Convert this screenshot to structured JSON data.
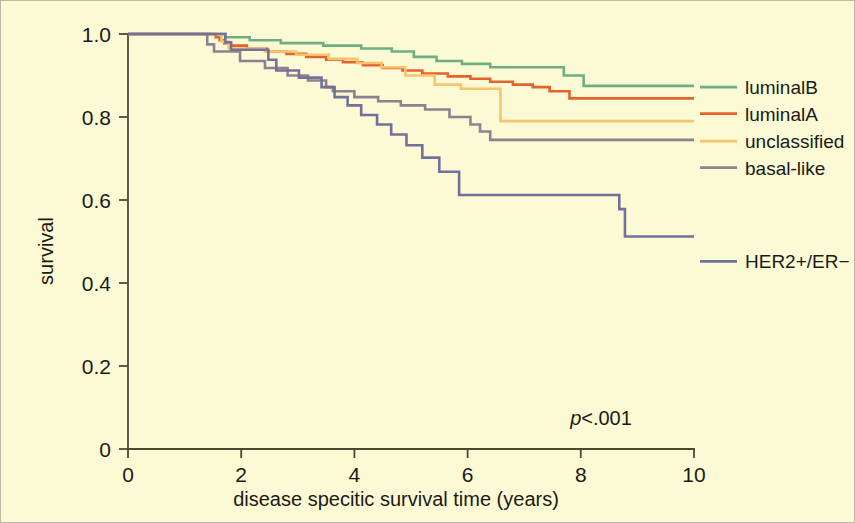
{
  "figure": {
    "background_color": "#fbfad4",
    "frame_color": "#b9b9a8",
    "axis_color": "#4a4a33"
  },
  "chart_data": {
    "type": "line",
    "title": "",
    "subtitle": "",
    "xlabel": "disease specitic survival time  (years)",
    "ylabel": "survival",
    "xlim": [
      0,
      10
    ],
    "ylim": [
      0,
      1.0
    ],
    "xticks": [
      0,
      2,
      4,
      6,
      8,
      10
    ],
    "xticklabels": [
      "0",
      "2",
      "4",
      "6",
      "8",
      "10"
    ],
    "yticks": [
      0,
      0.2,
      0.4,
      0.6,
      0.8,
      1.0
    ],
    "yticklabels": [
      "0",
      "0.2",
      "0.4",
      "0.6",
      "0.8",
      "1.0"
    ],
    "grid": false,
    "legend_position": "right",
    "annotations": [
      {
        "text": "p<.001",
        "italic_prefix": "p",
        "rest": "<.001",
        "x": 7.4,
        "y": 0.115
      }
    ],
    "series": [
      {
        "name": "luminalB",
        "color": "#6fae81",
        "label_y": 0.872,
        "points": [
          [
            0.0,
            1.0
          ],
          [
            0.55,
            1.0
          ],
          [
            1.6,
            1.0
          ],
          [
            1.72,
            0.992
          ],
          [
            2.05,
            0.992
          ],
          [
            2.15,
            0.985
          ],
          [
            2.6,
            0.985
          ],
          [
            2.7,
            0.978
          ],
          [
            3.35,
            0.978
          ],
          [
            3.45,
            0.972
          ],
          [
            4.0,
            0.972
          ],
          [
            4.12,
            0.965
          ],
          [
            4.55,
            0.965
          ],
          [
            4.66,
            0.958
          ],
          [
            4.95,
            0.958
          ],
          [
            5.05,
            0.945
          ],
          [
            5.35,
            0.945
          ],
          [
            5.45,
            0.935
          ],
          [
            5.8,
            0.935
          ],
          [
            5.9,
            0.928
          ],
          [
            6.3,
            0.928
          ],
          [
            6.4,
            0.92
          ],
          [
            7.6,
            0.92
          ],
          [
            7.7,
            0.9
          ],
          [
            7.95,
            0.9
          ],
          [
            8.05,
            0.875
          ],
          [
            10.0,
            0.875
          ]
        ]
      },
      {
        "name": "luminalA",
        "color": "#e4632c",
        "label_y": 0.808,
        "points": [
          [
            0.0,
            1.0
          ],
          [
            0.62,
            1.0
          ],
          [
            1.45,
            1.0
          ],
          [
            1.55,
            0.992
          ],
          [
            1.62,
            0.985
          ],
          [
            1.7,
            0.978
          ],
          [
            1.82,
            0.972
          ],
          [
            2.0,
            0.972
          ],
          [
            2.1,
            0.965
          ],
          [
            2.35,
            0.965
          ],
          [
            2.45,
            0.958
          ],
          [
            2.7,
            0.958
          ],
          [
            2.8,
            0.952
          ],
          [
            3.05,
            0.952
          ],
          [
            3.15,
            0.945
          ],
          [
            3.4,
            0.945
          ],
          [
            3.5,
            0.938
          ],
          [
            3.7,
            0.938
          ],
          [
            3.8,
            0.932
          ],
          [
            4.05,
            0.932
          ],
          [
            4.15,
            0.925
          ],
          [
            4.4,
            0.925
          ],
          [
            4.5,
            0.918
          ],
          [
            4.75,
            0.918
          ],
          [
            4.85,
            0.912
          ],
          [
            5.1,
            0.912
          ],
          [
            5.2,
            0.905
          ],
          [
            5.55,
            0.905
          ],
          [
            5.65,
            0.898
          ],
          [
            5.95,
            0.898
          ],
          [
            6.05,
            0.892
          ],
          [
            6.3,
            0.892
          ],
          [
            6.4,
            0.885
          ],
          [
            6.7,
            0.885
          ],
          [
            6.8,
            0.878
          ],
          [
            7.05,
            0.878
          ],
          [
            7.15,
            0.872
          ],
          [
            7.35,
            0.872
          ],
          [
            7.45,
            0.862
          ],
          [
            7.7,
            0.862
          ],
          [
            7.8,
            0.845
          ],
          [
            10.0,
            0.845
          ]
        ]
      },
      {
        "name": "unclassified",
        "color": "#f6c46d",
        "label_y": 0.742,
        "points": [
          [
            0.0,
            1.0
          ],
          [
            0.7,
            1.0
          ],
          [
            1.55,
            1.0
          ],
          [
            1.65,
            0.982
          ],
          [
            1.78,
            0.965
          ],
          [
            2.3,
            0.965
          ],
          [
            2.42,
            0.958
          ],
          [
            2.85,
            0.958
          ],
          [
            2.97,
            0.95
          ],
          [
            3.45,
            0.95
          ],
          [
            3.55,
            0.94
          ],
          [
            3.9,
            0.94
          ],
          [
            4.05,
            0.93
          ],
          [
            4.35,
            0.93
          ],
          [
            4.48,
            0.92
          ],
          [
            4.78,
            0.92
          ],
          [
            4.9,
            0.9
          ],
          [
            5.3,
            0.9
          ],
          [
            5.42,
            0.878
          ],
          [
            5.75,
            0.878
          ],
          [
            5.88,
            0.868
          ],
          [
            6.45,
            0.868
          ],
          [
            6.58,
            0.79
          ],
          [
            10.0,
            0.79
          ]
        ]
      },
      {
        "name": "basal-like",
        "color": "#8d8190",
        "label_y": 0.678,
        "points": [
          [
            0.0,
            1.0
          ],
          [
            0.5,
            1.0
          ],
          [
            1.3,
            1.0
          ],
          [
            1.4,
            0.975
          ],
          [
            1.52,
            0.958
          ],
          [
            1.88,
            0.958
          ],
          [
            1.98,
            0.935
          ],
          [
            2.3,
            0.935
          ],
          [
            2.42,
            0.918
          ],
          [
            2.7,
            0.918
          ],
          [
            2.82,
            0.9
          ],
          [
            3.05,
            0.9
          ],
          [
            3.18,
            0.888
          ],
          [
            3.38,
            0.888
          ],
          [
            3.5,
            0.872
          ],
          [
            3.62,
            0.862
          ],
          [
            3.88,
            0.862
          ],
          [
            4.0,
            0.848
          ],
          [
            4.3,
            0.848
          ],
          [
            4.42,
            0.838
          ],
          [
            4.7,
            0.838
          ],
          [
            4.82,
            0.828
          ],
          [
            5.12,
            0.828
          ],
          [
            5.25,
            0.818
          ],
          [
            5.55,
            0.818
          ],
          [
            5.68,
            0.8
          ],
          [
            5.95,
            0.8
          ],
          [
            6.05,
            0.782
          ],
          [
            6.22,
            0.765
          ],
          [
            6.4,
            0.745
          ],
          [
            10.0,
            0.745
          ]
        ]
      },
      {
        "name": "HER2+/ER−",
        "color": "#71719b",
        "label_y": 0.452,
        "points": [
          [
            0.0,
            1.0
          ],
          [
            0.58,
            1.0
          ],
          [
            1.62,
            1.0
          ],
          [
            1.72,
            0.98
          ],
          [
            1.82,
            0.962
          ],
          [
            2.38,
            0.962
          ],
          [
            2.48,
            0.938
          ],
          [
            2.62,
            0.912
          ],
          [
            2.9,
            0.912
          ],
          [
            3.02,
            0.895
          ],
          [
            3.3,
            0.895
          ],
          [
            3.42,
            0.872
          ],
          [
            3.55,
            0.872
          ],
          [
            3.65,
            0.848
          ],
          [
            3.78,
            0.848
          ],
          [
            3.88,
            0.828
          ],
          [
            4.02,
            0.828
          ],
          [
            4.12,
            0.805
          ],
          [
            4.3,
            0.805
          ],
          [
            4.4,
            0.782
          ],
          [
            4.55,
            0.782
          ],
          [
            4.65,
            0.758
          ],
          [
            4.8,
            0.758
          ],
          [
            4.92,
            0.732
          ],
          [
            5.08,
            0.732
          ],
          [
            5.2,
            0.702
          ],
          [
            5.38,
            0.702
          ],
          [
            5.5,
            0.668
          ],
          [
            5.72,
            0.668
          ],
          [
            5.85,
            0.612
          ],
          [
            8.55,
            0.612
          ],
          [
            8.68,
            0.578
          ],
          [
            8.78,
            0.512
          ],
          [
            10.0,
            0.512
          ]
        ]
      }
    ]
  },
  "legend": {
    "items": [
      {
        "label": "luminalB",
        "color": "#6fae81"
      },
      {
        "label": "luminalA",
        "color": "#e4632c"
      },
      {
        "label": "unclassified",
        "color": "#f6c46d"
      },
      {
        "label": "basal-like",
        "color": "#8d8190"
      },
      {
        "label": "HER2+/ER−",
        "color": "#71719b"
      }
    ]
  },
  "axes": {
    "y_title": "survival",
    "x_title": "disease specitic survival time  (years)",
    "x_tick_labels": [
      "0",
      "2",
      "4",
      "6",
      "8",
      "10"
    ],
    "y_tick_labels": [
      "0",
      "0.2",
      "0.4",
      "0.6",
      "0.8",
      "1.0"
    ]
  },
  "annotation": {
    "p_symbol": "p",
    "p_text": "<.001"
  }
}
